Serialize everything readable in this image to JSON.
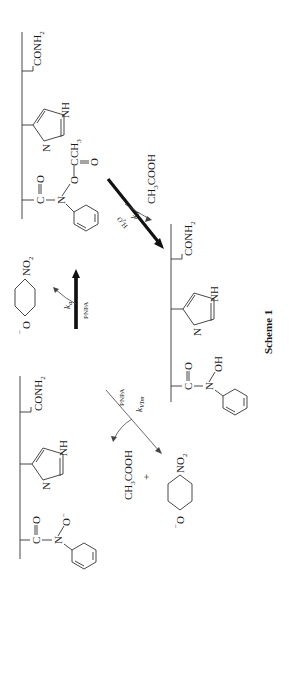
{
  "scheme": {
    "caption": "Scheme 1",
    "top_structure": {
      "name": "acetylated polymer (O-acetyl hydroxamate)",
      "groups": [
        "C",
        "O",
        "N",
        "O",
        "C",
        "CH3",
        "O",
        "N",
        "NH",
        "CONH2"
      ],
      "labels": {
        "carbonyl_c": "C",
        "carbonyl_o": "O",
        "n": "N",
        "ester_o": "O",
        "acyl_c": "C",
        "acyl_o": "O",
        "ch3": "CH",
        "ch3_sub": "3",
        "imid_n": "N",
        "imid_nh": "NH",
        "conh2": "CONH",
        "conh2_sub": "2"
      }
    },
    "left_structure": {
      "name": "anionic hydroxamate polymer",
      "labels": {
        "carbonyl_c": "C",
        "carbonyl_o": "O",
        "n": "N",
        "o_minus": "O",
        "minus": "−",
        "imid_n": "N",
        "imid_nh": "NH",
        "conh2": "CONH",
        "conh2_sub": "2"
      }
    },
    "right_structure": {
      "name": "neutral hydroxamic acid polymer",
      "labels": {
        "carbonyl_c": "C",
        "carbonyl_o": "O",
        "n": "N",
        "oh": "OH",
        "imid_n": "N",
        "imid_nh": "NH",
        "conh2": "CONH",
        "conh2_sub": "2"
      }
    },
    "arrows": {
      "ka": {
        "k": "k",
        "sub": "a",
        "reagent": "PNPA",
        "product_prefix": "−",
        "product_o": "O",
        "product_no2": "NO",
        "product_no2_sub": "2"
      },
      "kd": {
        "k": "k",
        "sub": "d",
        "reagent": "H",
        "reagent_sub": "2",
        "reagent_suffix": "O",
        "product": "CH",
        "product_sub": "3",
        "product_suffix": "COOH"
      },
      "kvim": {
        "k": "k",
        "sub": "VIm",
        "reagent": "PNPA",
        "product1": "CH",
        "product1_sub": "3",
        "product1_suffix": "COOH",
        "plus": "+",
        "product2_prefix": "−",
        "product2_o": "O",
        "product2_no2": "NO",
        "product2_no2_sub": "2"
      }
    }
  }
}
